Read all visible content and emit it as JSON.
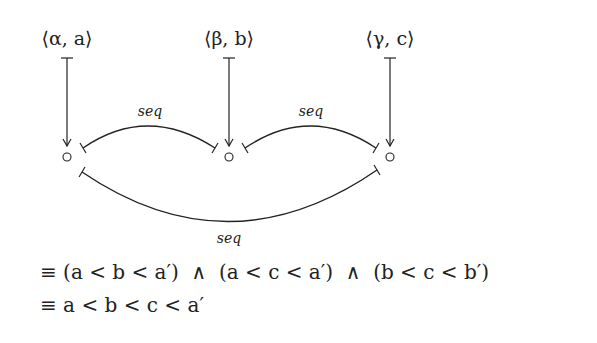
{
  "diagram": {
    "nodes": [
      {
        "id": "alpha",
        "label": "⟨α, a⟩",
        "x": 67,
        "y": 157
      },
      {
        "id": "beta",
        "label": "⟨β, b⟩",
        "x": 229,
        "y": 157
      },
      {
        "id": "gamma",
        "label": "⟨γ, c⟩",
        "x": 390,
        "y": 157
      }
    ],
    "edges": [
      {
        "from": "alpha",
        "to": "beta",
        "label": "seq"
      },
      {
        "from": "beta",
        "to": "gamma",
        "label": "seq"
      },
      {
        "from": "alpha",
        "to": "gamma",
        "label": "seq"
      }
    ]
  },
  "labels": {
    "node_alpha": "⟨α, a⟩",
    "node_beta": "⟨β, b⟩",
    "node_gamma": "⟨γ, c⟩",
    "edge_alpha_beta": "seq",
    "edge_beta_gamma": "seq",
    "edge_alpha_gamma": "seq"
  },
  "formulas": {
    "line1": "≡ (a < b < a′)  ∧  (a < c < a′)  ∧  (b < c < b′)",
    "line2": "≡ a < b < c < a′"
  },
  "colors": {
    "ink": "#222222",
    "background": "#ffffff"
  }
}
